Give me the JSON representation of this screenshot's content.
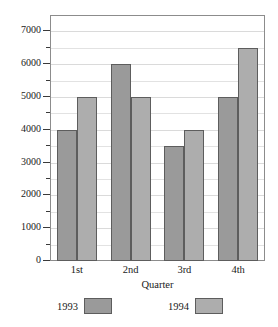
{
  "chart_data": {
    "type": "bar",
    "title": "",
    "subtitle": "",
    "xlabel": "Quarter",
    "ylabel": "",
    "categories": [
      "1st",
      "2nd",
      "3rd",
      "4th"
    ],
    "series": [
      {
        "name": "1993",
        "values": [
          4000,
          6000,
          3500,
          5000
        ],
        "color": "#9a9a9a"
      },
      {
        "name": "1994",
        "values": [
          5000,
          5000,
          4000,
          6500
        ],
        "color": "#adadad"
      }
    ],
    "ylim": [
      0,
      7500
    ],
    "ytick_labels": [
      "0",
      "1000",
      "2000",
      "3000",
      "4000",
      "5000",
      "6000",
      "7000"
    ],
    "ytick_values": [
      0,
      1000,
      2000,
      3000,
      4000,
      5000,
      6000,
      7000
    ],
    "yminor_values": [
      500,
      1500,
      2500,
      3500,
      4500,
      5500,
      6500,
      7500
    ],
    "grid": true,
    "grid_axis": "y",
    "legend_position": "bottom",
    "bar_outline_color": "#5d5d5d",
    "frame_color": "#8c8c8c",
    "background_color": "#ffffff"
  },
  "legend": {
    "entries": [
      {
        "label": "1993"
      },
      {
        "label": "1994"
      }
    ]
  }
}
